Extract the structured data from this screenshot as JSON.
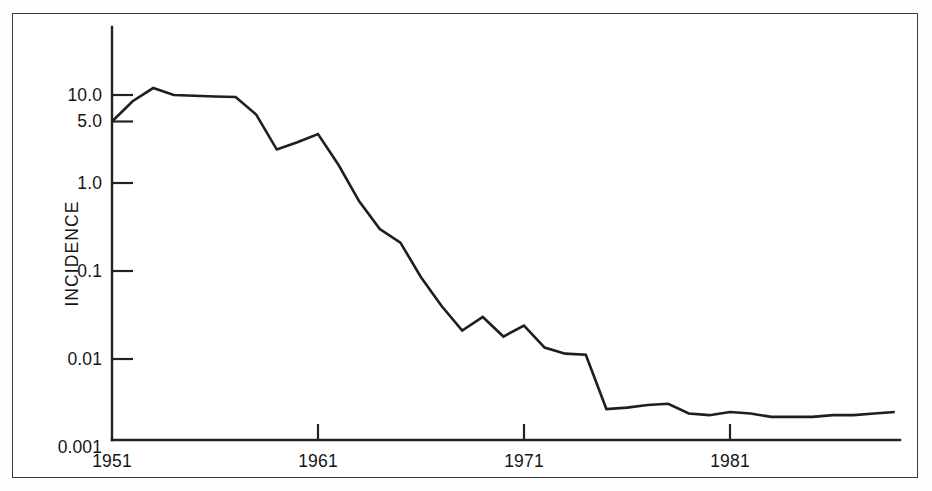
{
  "chart_data": {
    "type": "line",
    "title": "",
    "subtitle": "",
    "xlabel": "",
    "ylabel": "INCIDENCE",
    "yscale": "log",
    "ylim": [
      0.001,
      30.0
    ],
    "xlim": [
      1951,
      1989
    ],
    "grid": false,
    "legend": null,
    "ytick_labels": [
      "10.0",
      "5.0",
      "1.0",
      "0.1",
      "0.01",
      "0.001"
    ],
    "ytick_values": [
      10.0,
      5.0,
      1.0,
      0.1,
      0.01,
      0.001
    ],
    "xtick_labels": [
      "1951",
      "1961",
      "1971",
      "1981"
    ],
    "xtick_values": [
      1951,
      1961,
      1971,
      1981
    ],
    "series": [
      {
        "name": "Incidence",
        "color": "#1e1e1e",
        "x": [
          1951,
          1952,
          1953,
          1954,
          1955,
          1956,
          1957,
          1958,
          1959,
          1960,
          1961,
          1962,
          1963,
          1964,
          1965,
          1966,
          1967,
          1968,
          1969,
          1970,
          1971,
          1972,
          1973,
          1974,
          1975,
          1976,
          1977,
          1978,
          1979,
          1980,
          1981,
          1982,
          1983,
          1984,
          1985,
          1986,
          1987,
          1988,
          1989
        ],
        "y": [
          5.0,
          8.5,
          12.0,
          10.0,
          9.8,
          9.6,
          9.5,
          6.0,
          2.4,
          2.9,
          3.6,
          1.6,
          0.62,
          0.3,
          0.21,
          0.085,
          0.04,
          0.021,
          0.03,
          0.018,
          0.024,
          0.0135,
          0.0115,
          0.0112,
          0.0027,
          0.0028,
          0.003,
          0.0031,
          0.0024,
          0.0023,
          0.0025,
          0.0024,
          0.0022,
          0.0022,
          0.0022,
          0.0023,
          0.0023,
          0.0024,
          0.0025
        ]
      }
    ]
  },
  "axes": {
    "ylabel": "INCIDENCE",
    "yticks": [
      {
        "label": "10.0",
        "value": 10.0
      },
      {
        "label": "5.0",
        "value": 5.0
      },
      {
        "label": "1.0",
        "value": 1.0
      },
      {
        "label": "0.1",
        "value": 0.1
      },
      {
        "label": "0.01",
        "value": 0.01
      },
      {
        "label": "0.001",
        "value": 0.001
      }
    ],
    "xticks": [
      {
        "label": "1951",
        "value": 1951
      },
      {
        "label": "1961",
        "value": 1961
      },
      {
        "label": "1971",
        "value": 1971
      },
      {
        "label": "1981",
        "value": 1981
      }
    ]
  },
  "style": {
    "line_color": "#1e1e1e",
    "axis_color": "#222222",
    "frame_color": "#3a3a3a",
    "background": "#ffffff"
  }
}
